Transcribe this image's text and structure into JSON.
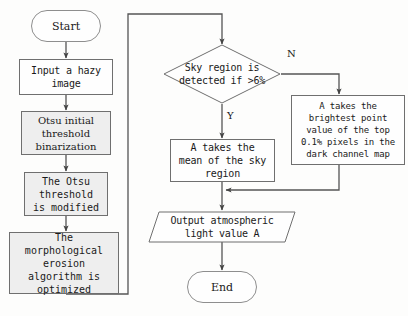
{
  "diagram": {
    "type": "flowchart",
    "stroke_color": "#555555",
    "shaded_fill": "#eeeeee",
    "plain_fill": "#fefefe",
    "background": "#fdfdfc"
  },
  "nodes": {
    "start": {
      "label": "Start",
      "shape": "terminator"
    },
    "input_hazy": {
      "label": "Input a hazy\nimage",
      "shape": "process"
    },
    "otsu_initial": {
      "label": "Otsu initial\nthreshold\nbinarization",
      "shape": "process"
    },
    "otsu_modified": {
      "label": "The Otsu\nthreshold\nis modified",
      "shape": "process"
    },
    "morphological": {
      "label": "The\nmorphological\nerosion\nalgorithm is\noptimized",
      "shape": "process"
    },
    "sky_decision": {
      "label": "Sky region is\ndetected if >6%",
      "shape": "decision"
    },
    "mean_sky": {
      "label": "A takes the\nmean of the sky\nregion",
      "shape": "process"
    },
    "brightest_point": {
      "label": "A takes the\nbrightest point\nvalue of the top\n0.1% pixels in the\ndark channel map",
      "shape": "process"
    },
    "output_light": {
      "label": "Output atmospheric\nlight value A",
      "shape": "data"
    },
    "end": {
      "label": "End",
      "shape": "terminator"
    }
  },
  "edge_labels": {
    "yes": "Y",
    "no": "N"
  }
}
